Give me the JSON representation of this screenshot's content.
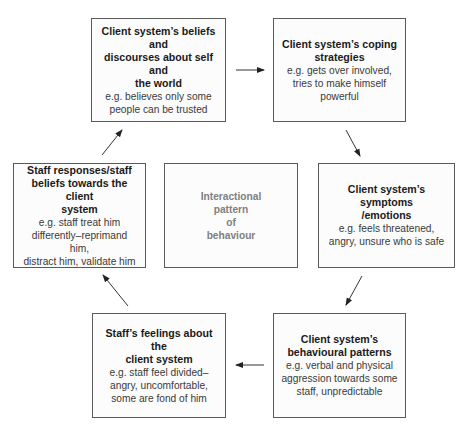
{
  "diagram": {
    "center": {
      "lines": [
        "Interactional",
        "pattern",
        "of",
        "behaviour"
      ]
    },
    "boxes": [
      {
        "id": "beliefs",
        "title_lines": [
          "Client system’s beliefs and",
          "discourses about self and",
          "the world"
        ],
        "body_lines": [
          "e.g. believes only some",
          "people can be trusted"
        ]
      },
      {
        "id": "coping",
        "title_lines": [
          "Client system’s coping",
          "strategies"
        ],
        "body_lines": [
          "e.g. gets over involved,",
          "tries to make himself",
          "powerful"
        ]
      },
      {
        "id": "symptoms",
        "title_lines": [
          "Client system’s symptoms",
          "/emotions"
        ],
        "body_lines": [
          "e.g. feels threatened,",
          "angry, unsure who is safe"
        ]
      },
      {
        "id": "behavioural",
        "title_lines": [
          "Client system’s",
          "behavioural patterns"
        ],
        "body_lines": [
          "e.g. verbal and physical",
          "aggression towards some",
          "staff, unpredictable"
        ]
      },
      {
        "id": "staff-feelings",
        "title_lines": [
          "Staff’s feelings about the",
          "client system"
        ],
        "body_lines": [
          "e.g. staff feel divided–",
          "angry, uncomfortable,",
          "some are fond of him"
        ]
      },
      {
        "id": "staff-responses",
        "title_lines": [
          "Staff responses/staff",
          "beliefs towards the client",
          "system"
        ],
        "body_lines": [
          "e.g. staff treat him",
          "differently–reprimand",
          "him,",
          "distract him, validate him"
        ]
      }
    ],
    "flow": [
      "beliefs",
      "coping",
      "symptoms",
      "behavioural",
      "staff-feelings",
      "staff-responses",
      "beliefs"
    ]
  }
}
